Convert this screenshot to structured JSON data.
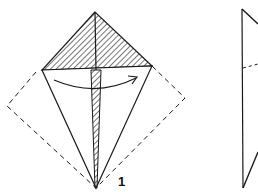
{
  "diagram": {
    "type": "origami-fold-instructions",
    "steps": [
      {
        "label": "1",
        "description": "Kite base with hatched top flap; curved arrow indicates folding left flap to the right; dashed outline shows original square"
      },
      {
        "label": "",
        "description": "Partial next-step figure, cut off at right edge"
      }
    ],
    "colors": {
      "line": "#1a1a1a",
      "background": "#ffffff"
    }
  }
}
